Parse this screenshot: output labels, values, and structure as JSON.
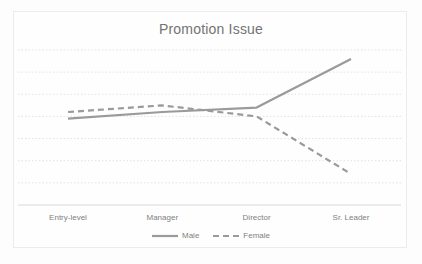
{
  "chart_data": {
    "type": "line",
    "title": "Promotion Issue",
    "categories": [
      "Entry-level",
      "Manager",
      "Director",
      "Sr. Leader"
    ],
    "series": [
      {
        "name": "Male",
        "style": "solid",
        "values": [
          3.9,
          4.2,
          4.4,
          6.6
        ]
      },
      {
        "name": "Female",
        "style": "dashed",
        "values": [
          4.2,
          4.5,
          4.0,
          1.4
        ]
      }
    ],
    "xlabel": "",
    "ylabel": "",
    "ylim": [
      0,
      7
    ],
    "y_tick_labels_visible": false,
    "grid": "horizontal-dotted",
    "legend_position": "bottom-center",
    "colors": {
      "line": "#9a9a9a",
      "grid": "#e3e3e3",
      "axis": "#d9d9d9",
      "text": "#7f7f7f",
      "title_text": "#737373",
      "border": "#ececec",
      "background": "#fdfdfd"
    }
  }
}
